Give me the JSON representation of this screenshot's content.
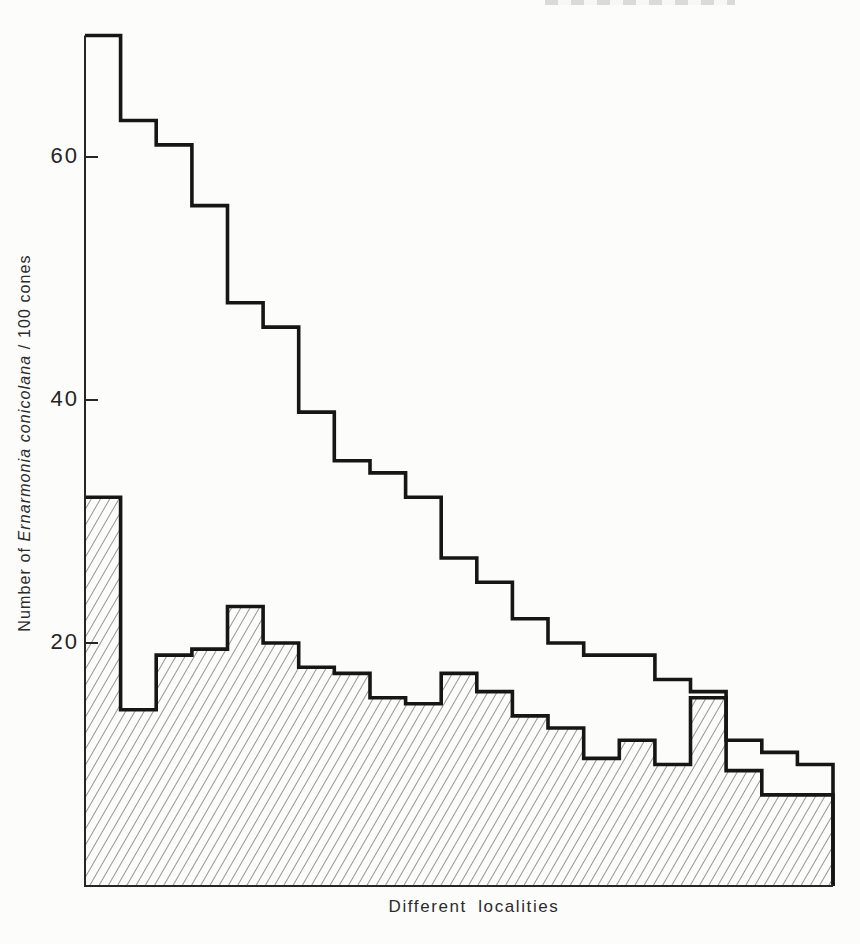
{
  "figure": {
    "ink_color": "#1d1d1d",
    "paper_color": "#fcfcfb"
  },
  "axes": {
    "y_ticks": [
      {
        "label": "60",
        "value": 60
      },
      {
        "label": "40",
        "value": 40
      },
      {
        "label": "20",
        "value": 20
      }
    ],
    "y_title": {
      "prefix": "Number of ",
      "italic": "Ernarmonia conicolana",
      "suffix": " / 100 cones"
    },
    "x_title": "Different localities"
  },
  "chart_data": {
    "type": "area",
    "subtype": "step-histogram, two superimposed step series over ranked localities",
    "title": "",
    "xlabel": "Different localities",
    "ylabel": "Number of Ernarmonia conicolana / 100 cones",
    "categories_note": "21 unlabeled localities, ranked left to right",
    "ylim": [
      0,
      70
    ],
    "grid": false,
    "legend": "none",
    "series": [
      {
        "name": "upper unshaded step outline",
        "style": "thick black step line, no fill",
        "values": [
          70,
          63,
          61,
          56,
          48,
          46,
          39,
          35,
          34,
          32,
          27,
          25,
          22,
          20,
          19,
          19,
          17,
          16,
          12,
          11,
          10
        ]
      },
      {
        "name": "lower hatched step area",
        "style": "thick black step line filled with diagonal hatching down to baseline",
        "values": [
          32,
          14.5,
          19,
          19.5,
          23,
          20,
          18,
          17.5,
          15.5,
          15,
          17.5,
          16,
          14,
          13,
          10.5,
          12,
          10,
          15.5,
          9.5,
          7.5,
          7.5
        ]
      }
    ]
  },
  "layout": {
    "left_x": 85,
    "right_x": 833,
    "baseline_y": 886,
    "px_per_unit": 12.15,
    "tick_length": 13
  }
}
